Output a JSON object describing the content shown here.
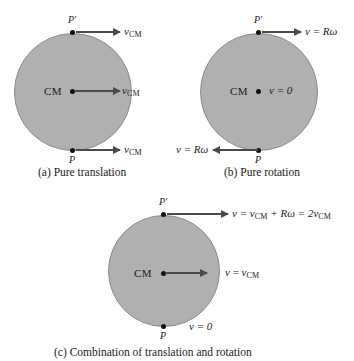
{
  "figure": {
    "background_color": "#ffffff",
    "disk_color": "#b0b0b0",
    "arrow_color": "#4a4a4a",
    "dot_color": "#111111"
  },
  "panels": [
    {
      "id": "a",
      "caption": "(a) Pure translation",
      "center_label": "CM",
      "top_point_label": "P′",
      "bottom_point_label": "P",
      "vectors": [
        {
          "name": "top",
          "label_v": "v",
          "label_sub": "CM",
          "direction": "right"
        },
        {
          "name": "center",
          "label_v": "v",
          "label_sub": "CM",
          "direction": "right"
        },
        {
          "name": "bottom",
          "label_v": "v",
          "label_sub": "CM",
          "direction": "right"
        }
      ]
    },
    {
      "id": "b",
      "caption": "(b) Pure rotation",
      "center_label": "CM",
      "center_value": "v = 0",
      "top_point_label": "P′",
      "bottom_point_label": "P",
      "vectors": [
        {
          "name": "top",
          "label": "v = Rω",
          "direction": "right"
        },
        {
          "name": "bottom",
          "label": "v = Rω",
          "direction": "left"
        }
      ]
    },
    {
      "id": "c",
      "caption": "(c) Combination of translation and rotation",
      "center_label": "CM",
      "top_point_label": "P′",
      "bottom_point_label": "P",
      "bottom_value": "v = 0",
      "center_value_v": "v",
      "center_value_eq": "=",
      "center_value_sub": "CM",
      "top_equation": {
        "prefix": "v = v",
        "sub1": "CM",
        "mid": " + Rω = 2v",
        "sub2": "CM"
      }
    }
  ]
}
